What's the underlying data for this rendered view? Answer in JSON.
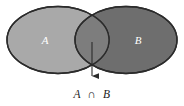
{
  "figure": {
    "kind": "venn-diagram-intersection",
    "background_color": "#ffffff",
    "width": 184,
    "height": 106
  },
  "sets": {
    "left": {
      "label": "A",
      "fill_color": "#a9a9a9",
      "outline_color": "#2b2b2b",
      "label_color": "#ffffff",
      "center_x": 58,
      "center_y": 40,
      "radius_x": 51,
      "radius_y": 33.5,
      "label_x": 45,
      "label_y": 41
    },
    "right": {
      "label": "B",
      "fill_color": "#6e6e6e",
      "outline_color": "#2b2b2b",
      "label_color": "#ffffff",
      "center_x": 126,
      "center_y": 40,
      "radius_x": 51,
      "radius_y": 33.5,
      "label_x": 138,
      "label_y": 41
    }
  },
  "intersection": {
    "fill_color": "#7d7d7d",
    "outline_color": "#2b2b2b"
  },
  "pointer": {
    "color": "#2b2b2b",
    "start_x": 92,
    "start_y": 42,
    "end_x": 92,
    "end_y": 83,
    "arrowhead_width": 6,
    "arrowhead_height": 7
  },
  "caption": {
    "left_operand": "A",
    "operator": "∩",
    "right_operand": "B",
    "full_text": "A ∩ B",
    "color": "#1a1a1a",
    "x": 92,
    "y": 95
  }
}
